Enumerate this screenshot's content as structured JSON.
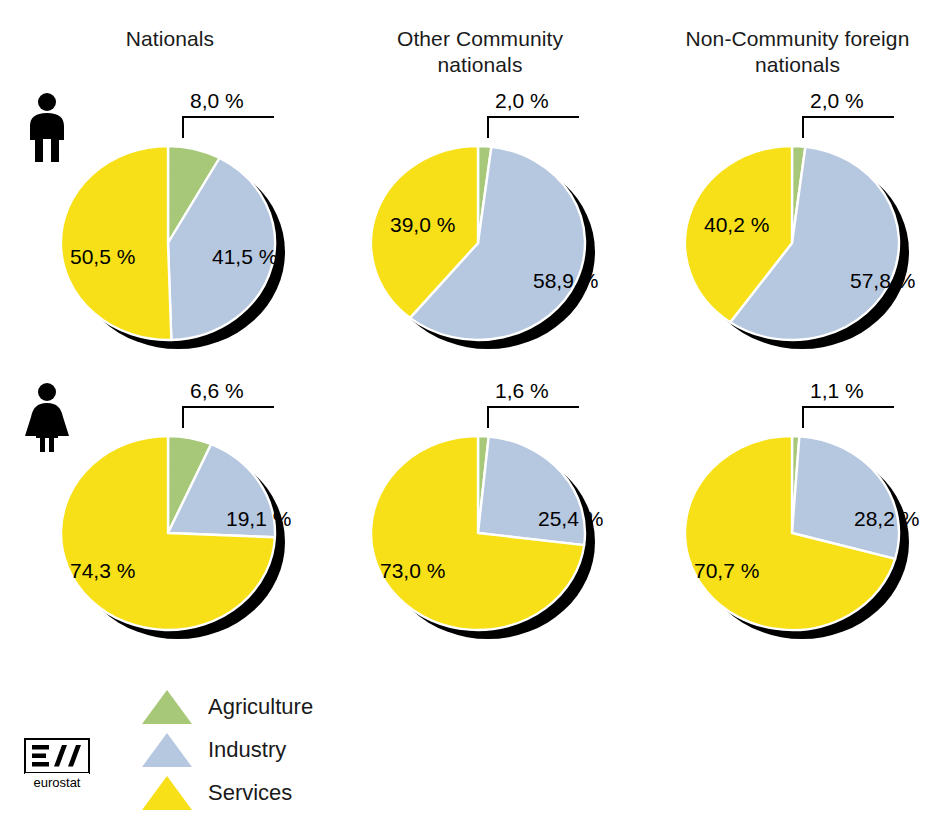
{
  "colors": {
    "agriculture": "#a6c878",
    "industry": "#b6c7e0",
    "services": "#f7e017",
    "shadow": "#000000",
    "separator": "#ffffff",
    "text": "#1a1a1a"
  },
  "columns": [
    {
      "title": "Nationals"
    },
    {
      "title": "Other Community nationals"
    },
    {
      "title": "Non-Community foreign nationals"
    }
  ],
  "rows": [
    {
      "gender": "male",
      "icon": "male-pictogram-icon"
    },
    {
      "gender": "female",
      "icon": "female-pictogram-icon"
    }
  ],
  "legend": {
    "items": [
      {
        "label": "Agriculture",
        "key": "agriculture",
        "marker": "triangle-marker-icon"
      },
      {
        "label": "Industry",
        "key": "industry",
        "marker": "triangle-marker-icon"
      },
      {
        "label": "Services",
        "key": "services",
        "marker": "triangle-marker-icon"
      }
    ]
  },
  "logo": {
    "name": "eurostat-logo",
    "wordmark": "eurostat"
  },
  "chart_data": {
    "type": "pie",
    "title": "",
    "legend_position": "bottom-left",
    "unit": "%",
    "decimal_separator": ",",
    "categories": [
      "Agriculture",
      "Industry",
      "Services"
    ],
    "category_colors": [
      "#a6c878",
      "#b6c7e0",
      "#f7e017"
    ],
    "column_labels": [
      "Nationals",
      "Other Community nationals",
      "Non-Community foreign nationals"
    ],
    "row_labels": [
      "Men",
      "Women"
    ],
    "panels": [
      {
        "row": "Men",
        "column": "Nationals",
        "values": [
          8.0,
          41.5,
          50.5
        ],
        "labels": [
          "8,0 %",
          "41,5 %",
          "50,5 %"
        ]
      },
      {
        "row": "Men",
        "column": "Other Community nationals",
        "values": [
          2.0,
          58.9,
          39.0
        ],
        "labels": [
          "2,0 %",
          "58,9 %",
          "39,0 %"
        ]
      },
      {
        "row": "Men",
        "column": "Non-Community foreign nationals",
        "values": [
          2.0,
          57.8,
          40.2
        ],
        "labels": [
          "2,0 %",
          "57,8 %",
          "40,2 %"
        ]
      },
      {
        "row": "Women",
        "column": "Nationals",
        "values": [
          6.6,
          19.1,
          74.3
        ],
        "labels": [
          "6,6 %",
          "19,1 %",
          "74,3 %"
        ]
      },
      {
        "row": "Women",
        "column": "Other Community nationals",
        "values": [
          1.6,
          25.4,
          73.0
        ],
        "labels": [
          "1,6 %",
          "25,4 %",
          "73,0 %"
        ]
      },
      {
        "row": "Women",
        "column": "Non-Community foreign nationals",
        "values": [
          1.1,
          28.2,
          70.7
        ],
        "labels": [
          "1,1 %",
          "28,2 %",
          "70,7 %"
        ]
      }
    ]
  },
  "layout": {
    "pie_origins": [
      {
        "left": 48,
        "top": 118
      },
      {
        "left": 358,
        "top": 118
      },
      {
        "left": 672,
        "top": 118
      },
      {
        "left": 48,
        "top": 408
      },
      {
        "left": 358,
        "top": 408
      },
      {
        "left": 672,
        "top": 408
      }
    ],
    "callout_origins": [
      {
        "left": 168,
        "top": 90
      },
      {
        "left": 473,
        "top": 90
      },
      {
        "left": 788,
        "top": 90
      },
      {
        "left": 168,
        "top": 380
      },
      {
        "left": 473,
        "top": 380
      },
      {
        "left": 788,
        "top": 380
      }
    ],
    "industry_label_offsets": [
      {
        "left": 164,
        "top": 128
      },
      {
        "left": 175,
        "top": 152
      },
      {
        "left": 178,
        "top": 152
      },
      {
        "left": 178,
        "top": 100
      },
      {
        "left": 180,
        "top": 100
      },
      {
        "left": 182,
        "top": 100
      }
    ],
    "services_label_offsets": [
      {
        "left": 22,
        "top": 128
      },
      {
        "left": 32,
        "top": 96
      },
      {
        "left": 32,
        "top": 96
      },
      {
        "left": 22,
        "top": 152
      },
      {
        "left": 22,
        "top": 152
      },
      {
        "left": 22,
        "top": 152
      }
    ]
  }
}
